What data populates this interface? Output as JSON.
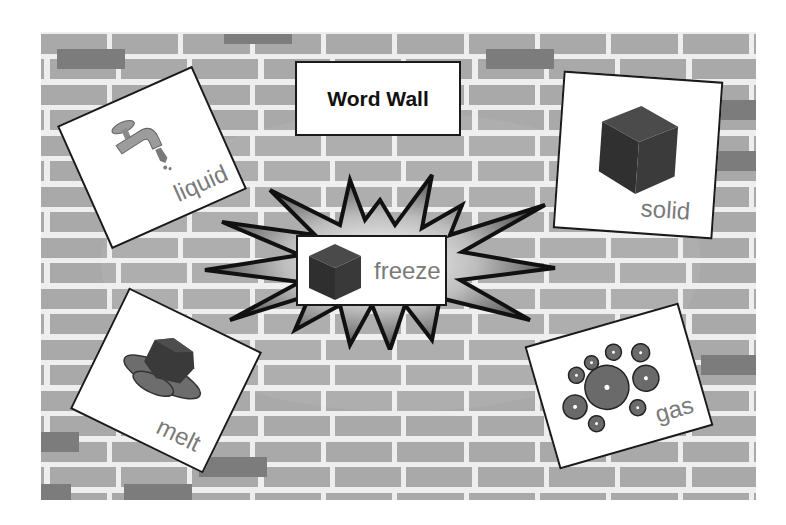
{
  "title": "Word Wall",
  "center_card": {
    "word": "freeze",
    "icon": "cube-icon"
  },
  "cards": [
    {
      "id": "liquid",
      "word": "liquid",
      "icon": "faucet-icon",
      "rotation_deg": -24
    },
    {
      "id": "solid",
      "word": "solid",
      "icon": "cube-icon",
      "rotation_deg": 4
    },
    {
      "id": "melt",
      "word": "melt",
      "icon": "melting-cube-icon",
      "rotation_deg": 26
    },
    {
      "id": "gas",
      "word": "gas",
      "icon": "flowers-icon",
      "rotation_deg": -16
    }
  ],
  "colors": {
    "mortar": "#eeeeee",
    "brick": "#a9a9a9",
    "brick_dark": "#7c7c7c",
    "card_border": "#1a1a1a",
    "word_text": "#7a7a7a",
    "cube_dark": "#3a3a3a"
  }
}
